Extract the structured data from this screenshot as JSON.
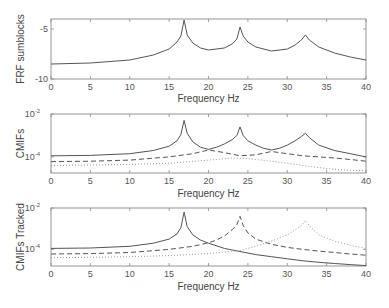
{
  "chart_data": [
    {
      "type": "line",
      "title": "",
      "xlabel": "Frequency Hz",
      "ylabel": "FRF sumblocks",
      "xlim": [
        0,
        40
      ],
      "ylim": [
        -10,
        -4
      ],
      "xticks": [
        0,
        5,
        10,
        15,
        20,
        25,
        30,
        35,
        40
      ],
      "yticks": [
        {
          "value": -5,
          "label": "-5"
        },
        {
          "value": -10,
          "label": "-10"
        }
      ],
      "yscale": "linear",
      "grid": false,
      "series": [
        {
          "name": "FRF sum",
          "style": "solid",
          "x": [
            0,
            5,
            10,
            13,
            15,
            16,
            16.5,
            16.9,
            17.3,
            18,
            19,
            20,
            22,
            23,
            23.6,
            24,
            24.4,
            25,
            26,
            28,
            30,
            31,
            31.8,
            32.3,
            32.8,
            34,
            36,
            38,
            40
          ],
          "y": [
            -8.5,
            -8.4,
            -8.1,
            -7.6,
            -7.0,
            -6.3,
            -5.7,
            -4.1,
            -5.6,
            -6.4,
            -6.9,
            -7.1,
            -6.9,
            -6.5,
            -6.0,
            -4.8,
            -5.7,
            -6.3,
            -6.8,
            -7.2,
            -7.0,
            -6.6,
            -6.1,
            -5.6,
            -6.1,
            -6.8,
            -7.4,
            -7.8,
            -8.1
          ]
        }
      ]
    },
    {
      "type": "line",
      "title": "",
      "xlabel": "Frequency Hz",
      "ylabel": "CMIFs",
      "xlim": [
        0,
        40
      ],
      "ylim_log10": [
        -4.75,
        -2
      ],
      "xticks": [
        0,
        5,
        10,
        15,
        20,
        25,
        30,
        35,
        40
      ],
      "yticks": [
        {
          "value": -2,
          "label": "10",
          "exp": "-2"
        },
        {
          "value": -4,
          "label": "10",
          "exp": "-4"
        }
      ],
      "yscale": "log",
      "grid": false,
      "series": [
        {
          "name": "CMIF 1",
          "style": "solid",
          "x": [
            0,
            5,
            10,
            13,
            15,
            16,
            16.5,
            16.9,
            17.3,
            18,
            19,
            20,
            21,
            22,
            23,
            23.6,
            24,
            24.4,
            25,
            26,
            27,
            28,
            29,
            30,
            31,
            31.8,
            32.3,
            32.8,
            34,
            36,
            38,
            40
          ],
          "y": [
            -3.95,
            -3.93,
            -3.85,
            -3.7,
            -3.5,
            -3.25,
            -2.95,
            -2.3,
            -2.9,
            -3.3,
            -3.55,
            -3.65,
            -3.55,
            -3.4,
            -3.2,
            -3.0,
            -2.6,
            -3.0,
            -3.25,
            -3.45,
            -3.6,
            -3.68,
            -3.6,
            -3.45,
            -3.25,
            -3.05,
            -2.9,
            -3.1,
            -3.45,
            -3.7,
            -3.85,
            -4.0
          ]
        },
        {
          "name": "CMIF 2",
          "style": "dashed",
          "x": [
            0,
            5,
            10,
            15,
            18,
            20,
            22,
            24,
            26,
            28,
            30,
            32,
            34,
            36,
            38,
            40
          ],
          "y": [
            -4.22,
            -4.2,
            -4.15,
            -4.0,
            -3.85,
            -3.68,
            -3.8,
            -3.95,
            -3.9,
            -3.75,
            -3.85,
            -3.95,
            -4.0,
            -4.05,
            -4.12,
            -4.2
          ]
        },
        {
          "name": "CMIF 3",
          "style": "dotted",
          "x": [
            0,
            5,
            10,
            15,
            20,
            23,
            25,
            28,
            30,
            32,
            34,
            36,
            38,
            40
          ],
          "y": [
            -4.4,
            -4.38,
            -4.35,
            -4.3,
            -4.15,
            -4.05,
            -4.08,
            -4.2,
            -4.3,
            -4.4,
            -4.5,
            -4.58,
            -4.62,
            -4.65
          ]
        }
      ]
    },
    {
      "type": "line",
      "title": "",
      "xlabel": "Frequency Hz",
      "ylabel": "CMIFs Tracked",
      "xlim": [
        0,
        40
      ],
      "ylim_log10": [
        -4.8,
        -2
      ],
      "xticks": [
        0,
        5,
        10,
        15,
        20,
        25,
        30,
        35,
        40
      ],
      "yticks": [
        {
          "value": -2,
          "label": "10",
          "exp": "-2"
        },
        {
          "value": -4,
          "label": "10",
          "exp": "-4"
        }
      ],
      "yscale": "log",
      "grid": false,
      "series": [
        {
          "name": "Mode 1 tracked",
          "style": "solid",
          "x": [
            0,
            5,
            10,
            13,
            15,
            16,
            16.5,
            16.9,
            17.3,
            18,
            19,
            20,
            22,
            24,
            26,
            28,
            30,
            32,
            34,
            36,
            38,
            40
          ],
          "y": [
            -3.95,
            -3.93,
            -3.85,
            -3.7,
            -3.5,
            -3.25,
            -2.95,
            -2.2,
            -2.9,
            -3.3,
            -3.55,
            -3.7,
            -3.95,
            -4.1,
            -4.25,
            -4.35,
            -4.45,
            -4.55,
            -4.62,
            -4.68,
            -4.73,
            -4.78
          ]
        },
        {
          "name": "Mode 2 tracked",
          "style": "dashed",
          "x": [
            0,
            5,
            10,
            15,
            18,
            20,
            21,
            22,
            23,
            23.6,
            24,
            24.4,
            25,
            26,
            28,
            30,
            32,
            34,
            36,
            38,
            40
          ],
          "y": [
            -4.22,
            -4.2,
            -4.15,
            -4.0,
            -3.85,
            -3.68,
            -3.55,
            -3.35,
            -3.05,
            -2.8,
            -2.4,
            -2.85,
            -3.2,
            -3.5,
            -3.75,
            -3.9,
            -4.0,
            -4.08,
            -4.15,
            -4.22,
            -4.28
          ]
        },
        {
          "name": "Mode 3 tracked",
          "style": "dotted",
          "x": [
            0,
            5,
            10,
            15,
            20,
            24,
            26,
            28,
            30,
            31,
            31.8,
            32.3,
            32.8,
            34,
            36,
            38,
            40
          ],
          "y": [
            -4.4,
            -4.38,
            -4.35,
            -4.3,
            -4.2,
            -4.05,
            -3.85,
            -3.6,
            -3.3,
            -3.05,
            -2.85,
            -2.6,
            -2.85,
            -3.3,
            -3.6,
            -3.8,
            -3.95
          ]
        }
      ]
    }
  ]
}
